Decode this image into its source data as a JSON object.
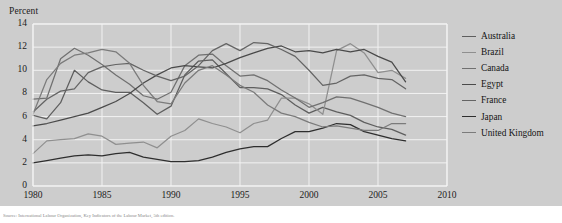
{
  "figure": {
    "background_color": "#cdcdcd",
    "source_note": "Source: International Labour Organization, Key Indicators of the Labour Market, 5th edition."
  },
  "chart_data": {
    "type": "line",
    "title": "",
    "ylabel": "Percent",
    "xlabel": "",
    "ylim": [
      0,
      14
    ],
    "xlim": [
      1980,
      2010
    ],
    "yticks": [
      0,
      2,
      4,
      6,
      8,
      10,
      12,
      14
    ],
    "xticks": [
      1980,
      1985,
      1990,
      1995,
      2000,
      2005,
      2010
    ],
    "grid": true,
    "legend_position": "right",
    "x": [
      1980,
      1981,
      1982,
      1983,
      1984,
      1985,
      1986,
      1987,
      1988,
      1989,
      1990,
      1991,
      1992,
      1993,
      1994,
      1995,
      1996,
      1997,
      1998,
      1999,
      2000,
      2001,
      2002,
      2003,
      2004,
      2005,
      2006,
      2007
    ],
    "series": [
      {
        "name": "Australia",
        "color": "#5e5e5e",
        "values": [
          6.1,
          5.8,
          7.2,
          10.0,
          9.0,
          8.3,
          8.1,
          8.1,
          7.2,
          6.2,
          6.9,
          9.6,
          10.8,
          10.9,
          9.7,
          8.5,
          8.5,
          8.4,
          7.9,
          7.0,
          6.3,
          6.8,
          6.4,
          6.1,
          5.5,
          5.1,
          4.9,
          4.4
        ]
      },
      {
        "name": "Brazil",
        "color": "#8f8f8f",
        "values": [
          2.8,
          3.9,
          4.0,
          4.1,
          4.5,
          4.3,
          3.6,
          3.7,
          3.8,
          3.3,
          4.3,
          4.8,
          5.8,
          5.4,
          5.1,
          4.6,
          5.4,
          5.7,
          7.6,
          7.6,
          7.1,
          6.2,
          11.7,
          12.3,
          11.5,
          9.8,
          10.0,
          9.3
        ]
      },
      {
        "name": "Canada",
        "color": "#707070",
        "values": [
          7.5,
          7.6,
          11.0,
          11.9,
          11.3,
          10.5,
          9.6,
          8.8,
          7.8,
          7.5,
          8.1,
          10.4,
          11.3,
          11.4,
          10.4,
          9.5,
          9.6,
          9.1,
          8.3,
          7.6,
          6.8,
          7.2,
          7.7,
          7.6,
          7.2,
          6.8,
          6.3,
          6.0
        ]
      },
      {
        "name": "Egypt",
        "color": "#4a4a4a",
        "values": [
          5.2,
          5.4,
          5.7,
          6.0,
          6.3,
          6.8,
          7.3,
          8.0,
          8.9,
          9.6,
          10.2,
          10.4,
          10.3,
          10.2,
          10.6,
          11.1,
          11.5,
          11.9,
          12.1,
          11.6,
          11.7,
          11.5,
          11.8,
          11.6,
          11.8,
          11.2,
          10.7,
          9.0
        ]
      },
      {
        "name": "France",
        "color": "#646464",
        "values": [
          6.4,
          7.5,
          8.2,
          8.4,
          9.8,
          10.3,
          10.5,
          10.6,
          10.0,
          9.5,
          9.1,
          9.5,
          10.4,
          11.7,
          12.3,
          11.7,
          12.4,
          12.3,
          11.8,
          11.2,
          10.0,
          8.7,
          8.9,
          9.5,
          9.6,
          9.3,
          9.2,
          8.4
        ]
      },
      {
        "name": "Japan",
        "color": "#2e2e2e",
        "values": [
          2.0,
          2.2,
          2.4,
          2.6,
          2.7,
          2.6,
          2.8,
          2.9,
          2.5,
          2.3,
          2.1,
          2.1,
          2.2,
          2.5,
          2.9,
          3.2,
          3.4,
          3.4,
          4.1,
          4.7,
          4.7,
          5.0,
          5.4,
          5.3,
          4.7,
          4.4,
          4.1,
          3.9
        ]
      },
      {
        "name": "United Kingdom",
        "color": "#7b7b7b",
        "values": [
          6.2,
          9.2,
          10.6,
          11.3,
          11.5,
          11.8,
          11.6,
          10.6,
          8.7,
          7.3,
          7.1,
          8.9,
          10.0,
          10.4,
          9.6,
          8.7,
          8.1,
          7.0,
          6.3,
          6.0,
          5.5,
          5.1,
          5.2,
          5.0,
          4.8,
          4.8,
          5.4,
          5.4
        ]
      }
    ]
  },
  "legend": {
    "items": [
      {
        "label": "Australia"
      },
      {
        "label": "Brazil"
      },
      {
        "label": "Canada"
      },
      {
        "label": "Egypt"
      },
      {
        "label": "France"
      },
      {
        "label": "Japan"
      },
      {
        "label": "United Kingdom"
      }
    ]
  }
}
